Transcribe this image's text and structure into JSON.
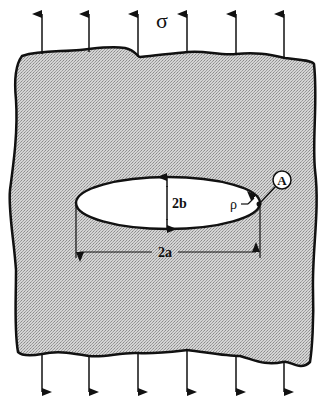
{
  "diagram": {
    "stress_symbol": "σ",
    "labels": {
      "minor_axis": "2b",
      "major_axis": "2a",
      "radius": "ρ",
      "point": "A"
    },
    "top_arrows_x": [
      42,
      89,
      138,
      187,
      236,
      284
    ],
    "bottom_arrows_x": [
      42,
      89,
      138,
      187,
      236,
      284
    ],
    "colors": {
      "plate_fill": "#c9c9c9",
      "hole_fill": "#ffffff",
      "stroke": "#111111"
    }
  }
}
